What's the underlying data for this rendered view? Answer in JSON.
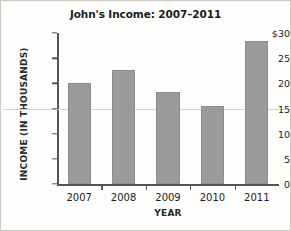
{
  "chart_data": {
    "type": "bar",
    "title": "John's Income: 2007–2011",
    "xlabel": "YEAR",
    "ylabel": "INCOME  (IN THOUSANDS)",
    "categories": [
      "2007",
      "2008",
      "2009",
      "2010",
      "2011"
    ],
    "values": [
      20.1,
      22.6,
      18.3,
      15.4,
      28.4
    ],
    "ylim": [
      0,
      30
    ],
    "yticks": [
      0,
      5,
      10,
      15,
      20,
      25,
      30
    ],
    "ytick_labels": [
      "0",
      "5",
      "10",
      "15",
      "20",
      "25",
      "$30"
    ],
    "grid": false,
    "legend": null,
    "bar_color": "#9b9b9b",
    "axis_color": "#55555a",
    "reference_line": {
      "value": 15,
      "color": "#e8c6c0"
    }
  }
}
